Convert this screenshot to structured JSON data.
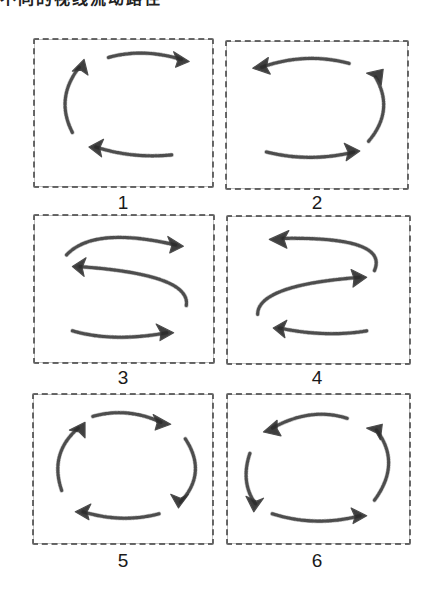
{
  "heading": {
    "text": "不同的视线流动路径"
  },
  "panels": [
    {
      "label": "1",
      "description": "C-shaped flow: top arrow left-to-right, left arc going up, bottom arrow right-to-left"
    },
    {
      "label": "2",
      "description": "Reverse-C flow: top arrow right-to-left, right arc going up, bottom arrow left-to-right"
    },
    {
      "label": "3",
      "description": "S-shaped flow: top arrow to the right, middle arrow to the left, bottom arrow to the right"
    },
    {
      "label": "4",
      "description": "Reverse S-shaped flow: top arrow to the left, middle arrow to the right, bottom arrow to the left"
    },
    {
      "label": "5",
      "description": "Clockwise circular flow with four arrows"
    },
    {
      "label": "6",
      "description": "Counter-clockwise circular flow with four arrows"
    }
  ],
  "colors": {
    "stroke": "#3a3a3a",
    "border": "#6a6a6a",
    "background": "#ffffff",
    "text": "#1a1a1a"
  }
}
